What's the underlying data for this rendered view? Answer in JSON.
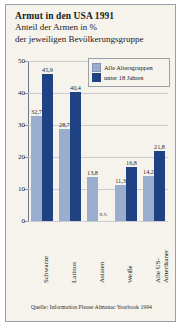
{
  "card": {
    "title": "Armut in den USA 1991",
    "subtitle_line1": "Anteil der Armen in %",
    "subtitle_line2": "der jeweiligen Bevölkerungsgruppe",
    "source": "Quelle: Information Please Almanac Yearbook 1994",
    "edge_text": ""
  },
  "legend": {
    "position": "top-right",
    "items": [
      {
        "label": "Alle Altersgruppen",
        "color": "#9aadcd"
      },
      {
        "label": "unter 18 Jahren",
        "color": "#1f4382"
      }
    ]
  },
  "axis": {
    "y_ticks": [
      "0",
      "10",
      "20",
      "30",
      "40",
      "50"
    ],
    "y_min": 0,
    "y_max": 50,
    "na_marker": "n.v."
  },
  "chart_data": {
    "type": "bar",
    "title": "Armut in den USA 1991",
    "subtitle": "Anteil der Armen in % der jeweiligen Bevölkerungsgruppe",
    "xlabel": "",
    "ylabel": "",
    "ylim": [
      0,
      50
    ],
    "yticks": [
      0,
      10,
      20,
      30,
      40,
      50
    ],
    "grid": true,
    "legend_position": "top-right",
    "categories": [
      "Schwarze",
      "Latinos",
      "Asiaten",
      "Weiße",
      "Alle US-Amerikaner"
    ],
    "category_labels_multiline": [
      "Schwarze",
      "Latinos",
      "Asiaten",
      "Weiße",
      "Alle US-\nAmerikaner"
    ],
    "series": [
      {
        "name": "Alle Altersgruppen",
        "color": "#9aadcd",
        "values": [
          32.7,
          28.7,
          13.8,
          11.3,
          14.2
        ],
        "labels": [
          "32,7",
          "28,7",
          "13,8",
          "11,3",
          "14,2"
        ]
      },
      {
        "name": "unter 18 Jahren",
        "color": "#1f4382",
        "values": [
          45.9,
          40.4,
          null,
          16.8,
          21.8
        ],
        "labels": [
          "45,9",
          "40,4",
          "n.v.",
          "16,8",
          "21,8"
        ]
      }
    ],
    "source": "Quelle: Information Please Almanac Yearbook 1994"
  }
}
